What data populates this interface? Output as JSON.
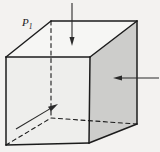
{
  "figure": {
    "background_color": "#f3f2f0",
    "label": {
      "text": "P",
      "subscript": "1",
      "full": "P1",
      "x": 22,
      "y": 26,
      "color": "#1b1b1b"
    },
    "solid": {
      "kind": "rectangular-box",
      "edge_color": "#1c1c1c",
      "edge_width": 1.5,
      "hidden_edge_style": "dashed",
      "hidden_edge_dash": "4,3.5",
      "vertices": {
        "front_top_left": [
          6,
          57
        ],
        "front_top_right": [
          90,
          57
        ],
        "front_bottom_right": [
          89,
          143
        ],
        "front_bottom_left": [
          6,
          145
        ],
        "back_top_left": [
          51,
          21
        ],
        "back_top_right": [
          137,
          21
        ],
        "back_bottom_right": [
          137,
          124
        ],
        "back_bottom_left": [
          51,
          118
        ]
      },
      "faces": [
        {
          "name": "front-face",
          "fill": "#eeeeec",
          "points": "6,57 90,57 89,143 6,145"
        },
        {
          "name": "top-face",
          "fill": "#f6f6f4",
          "points": "6,57 51,21 137,21 90,57"
        },
        {
          "name": "right-face",
          "fill": "#cdcdcb",
          "points": "90,57 137,21 137,124 89,143"
        }
      ],
      "visible_edges": [
        {
          "name": "front-top-edge",
          "points": "6,57 90,57"
        },
        {
          "name": "front-right-edge",
          "points": "90,57 89,143"
        },
        {
          "name": "front-bottom-edge",
          "points": "89,143 6,145"
        },
        {
          "name": "front-left-edge",
          "points": "6,145 6,57"
        },
        {
          "name": "top-left-receding-edge",
          "points": "6,57 51,21"
        },
        {
          "name": "top-back-edge",
          "points": "51,21 137,21"
        },
        {
          "name": "top-right-receding-edge",
          "points": "137,21 90,57"
        },
        {
          "name": "back-right-vertical-edge",
          "points": "137,21 137,124"
        },
        {
          "name": "bottom-right-receding-edge",
          "points": "137,124 89,143"
        }
      ],
      "hidden_edges": [
        {
          "name": "hidden-vertical-edge",
          "points": "51,21 51,118"
        },
        {
          "name": "hidden-left-receding-edge",
          "points": "6,145 51,118"
        },
        {
          "name": "hidden-bottom-receding-edge",
          "points": "51,118 137,124"
        }
      ]
    },
    "arrows": [
      {
        "name": "top-pressure-arrow",
        "direction": "down",
        "from": [
          72,
          3
        ],
        "to": [
          72,
          46
        ],
        "color": "#2a2a2a",
        "shaft_width": 1.1,
        "head_length": 9,
        "head_width": 5
      },
      {
        "name": "right-pressure-arrow",
        "direction": "left",
        "from": [
          159,
          78
        ],
        "to": [
          113,
          78
        ],
        "color": "#2a2a2a",
        "shaft_width": 1.1,
        "head_length": 9,
        "head_width": 5
      },
      {
        "name": "lower-left-pressure-arrow",
        "direction": "up-right",
        "from": [
          16,
          129
        ],
        "to": [
          58,
          104
        ],
        "color": "#2a2a2a",
        "shaft_width": 1.1,
        "head_length": 10,
        "head_width": 5.5
      }
    ]
  }
}
